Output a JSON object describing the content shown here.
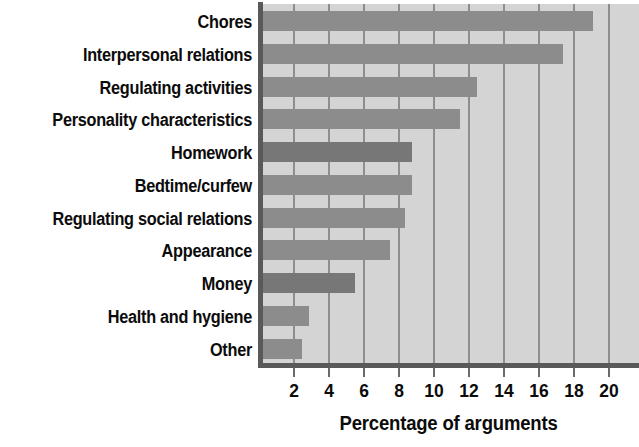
{
  "chart_data": {
    "type": "bar",
    "orientation": "horizontal",
    "title": "",
    "xlabel": "Percentage of arguments",
    "ylabel": "",
    "xlim": [
      0,
      21
    ],
    "xticks": [
      2,
      4,
      6,
      8,
      10,
      12,
      14,
      16,
      18,
      20
    ],
    "xtick_labels": [
      "2",
      "4",
      "6",
      "8",
      "10",
      "12",
      "14",
      "16",
      "18",
      "20"
    ],
    "grid": true,
    "grid_axis": "x",
    "legend": false,
    "categories": [
      "Chores",
      "Interpersonal relations",
      "Regulating activities",
      "Personality characteristics",
      "Homework",
      "Bedtime/curfew",
      "Regulating social relations",
      "Appearance",
      "Money",
      "Health and hygiene",
      "Other"
    ],
    "values": [
      19.0,
      17.3,
      12.4,
      11.4,
      8.7,
      8.7,
      8.3,
      7.4,
      5.4,
      2.8,
      2.4
    ],
    "bar_color": "#8c8c8c",
    "bar_color_alt": "#777777",
    "plot_background": "#d4d4d4",
    "axis_color": "#595959",
    "gridline_color": "#8e8e8e",
    "text_color": "#0b0b0b"
  }
}
